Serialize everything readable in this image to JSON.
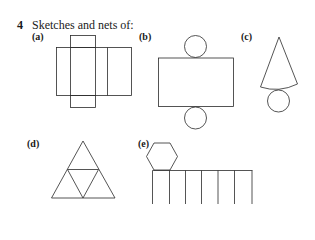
{
  "question": {
    "number": "4",
    "title": "Sketches and nets of:"
  },
  "parts": [
    {
      "label": "(a)",
      "shape": "cuboid-net"
    },
    {
      "label": "(b)",
      "shape": "cylinder-net"
    },
    {
      "label": "(c)",
      "shape": "cone-net"
    },
    {
      "label": "(d)",
      "shape": "tetrahedron-net"
    },
    {
      "label": "(e)",
      "shape": "hexagonal-prism-net"
    }
  ],
  "colors": {
    "line": "#2a2a2a",
    "background": "#ffffff"
  }
}
